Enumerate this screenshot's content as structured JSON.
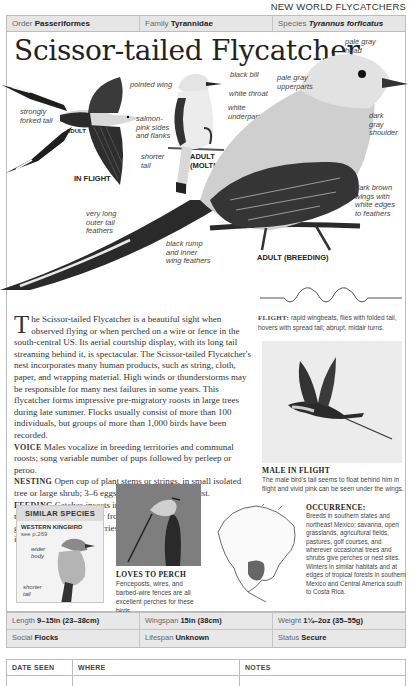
{
  "section_header": "NEW WORLD FLYCATCHERS",
  "meta": {
    "order_label": "Order",
    "order_value": "Passeriformes",
    "family_label": "Family",
    "family_value": "Tyrannidae",
    "species_label": "Species",
    "species_value": "Tyrannus forficatus"
  },
  "title": "Scissor-tailed Flycatcher",
  "illustration_labels": {
    "in_flight": {
      "pointed_wing": "pointed wing",
      "strongly_forked_tail": [
        "strongly",
        "forked tail"
      ],
      "adult": "ADULT",
      "caption": "IN FLIGHT"
    },
    "molting": {
      "black_bill": "black bill",
      "white_throat": "white throat",
      "white_underparts": [
        "white",
        "underparts"
      ],
      "salmon_pink": [
        "salmon-",
        "pink sides",
        "and flanks"
      ],
      "shorter_tail": [
        "shorter",
        "tail"
      ],
      "caption": [
        "ADULT",
        "(MOLTING)"
      ]
    },
    "breeding": {
      "pale_gray_head": [
        "pale gray",
        "head"
      ],
      "pale_gray_upperparts": [
        "pale gray",
        "upperparts"
      ],
      "dark_gray_shoulder": [
        "dark",
        "gray",
        "shoulder"
      ],
      "dark_brown_wings": [
        "dark brown",
        "wings with",
        "white edges",
        "to feathers"
      ],
      "long_outer_tail": [
        "very long",
        "outer tail",
        "feathers"
      ],
      "black_rump": [
        "black rump",
        "and inner",
        "wing feathers"
      ],
      "caption": "ADULT (BREEDING)"
    }
  },
  "description": {
    "dropcap": "T",
    "intro": "he Scissor-tailed Flycatcher is a beautiful sight when observed flying or when perched on a wire or fence in the south-central US. Its aerial courtship display, with its long tail streaming behind it, is spectacular. The Scissor-tailed Flycatcher's nest incorporates many human products, such as string, cloth, paper, and wrapping material. High winds or thunderstorms may be responsible for many nest failures in some years. This flycatcher forms impressive pre-migratory roosts in large trees during late summer. Flocks usually consist of more than 100 individuals, but groups of more than 1,000 birds have been recorded.",
    "voice_label": "VOICE",
    "voice_text": " Males vocalize in breeding territories and communal roosts; song variable number of pups followed by perleep or peroo.",
    "nesting_label": "NESTING",
    "nesting_text": " Open cup of plant stems or strings, in small isolated tree or large shrub; 3–6 eggs; 1 brood; March–August.",
    "feeding_label": "FEEDING",
    "feeding_text": " Catches insects in midair, also from trees or from ground; eats fruit and berries in winter."
  },
  "flight": {
    "label": "FLIGHT:",
    "text": " rapid wingbeats, flies with folded tail, hovers with spread tail; abrupt, midair turns."
  },
  "male_in_flight": {
    "title": "MALE IN FLIGHT",
    "text": "The male bird's tail seems to float behind him in flight and vivid pink can be seen under the wings."
  },
  "loves_to_perch": {
    "title": "LOVES TO PERCH",
    "text": "Fenceposts, wires, and barbed-wire fences are all excellent perches for these birds."
  },
  "similar_species": {
    "heading": "SIMILAR SPECIES",
    "name": "WESTERN KINGBIRD",
    "ref": "see p.269",
    "wider_body": [
      "wider",
      "body"
    ],
    "shorter_tail": [
      "shorter",
      "tail"
    ]
  },
  "occurrence": {
    "title": "OCCURRENCE:",
    "text": "Breeds in southern states and northeast Mexico; savanna, open grasslands, agricultural fields, pastures, golf courses, and wherever occasional trees and shrubs give perches or nest sites. Winters in similar habitats and at edges of tropical forests in southern Mexico and Central America south to Costa Rica."
  },
  "stats": {
    "length_label": "Length",
    "length_value": "9–15in (23–38cm)",
    "wingspan_label": "Wingspan",
    "wingspan_value": "15in (38cm)",
    "weight_label": "Weight",
    "weight_value": "1¼–2oz (35–55g)",
    "social_label": "Social",
    "social_value": "Flocks",
    "lifespan_label": "Lifespan",
    "lifespan_value": "Unknown",
    "status_label": "Status",
    "status_value": "Secure"
  },
  "log": {
    "col_date": "DATE SEEN",
    "col_where": "WHERE",
    "col_notes": "NOTES"
  }
}
